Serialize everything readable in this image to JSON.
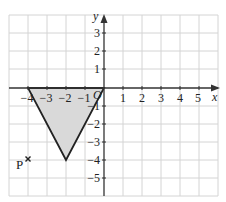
{
  "diagram": {
    "type": "coordinate-grid",
    "x_axis": {
      "label": "x",
      "range": [
        -5,
        6
      ],
      "tick_labels": [
        "−4",
        "−3",
        "−2",
        "−1",
        "1",
        "2",
        "3",
        "4",
        "5"
      ],
      "tick_values": [
        -4,
        -3,
        -2,
        -1,
        1,
        2,
        3,
        4,
        5
      ]
    },
    "y_axis": {
      "label": "y",
      "range": [
        -6,
        4
      ],
      "tick_labels": [
        "3",
        "2",
        "1",
        "−1",
        "−2",
        "−3",
        "−4",
        "−5"
      ],
      "tick_values": [
        3,
        2,
        1,
        -1,
        -2,
        -3,
        -4,
        -5
      ]
    },
    "origin_label": "O",
    "shape": {
      "name": "triangle",
      "vertices": [
        [
          -4,
          0
        ],
        [
          0,
          0
        ],
        [
          -2,
          -4
        ]
      ],
      "fill_color": "#d9d9d9",
      "stroke_color": "#222222"
    },
    "point": {
      "label": "P",
      "marker": "×",
      "coords": [
        -4,
        -4
      ]
    },
    "colors": {
      "grid": "#d4d4d4",
      "axis": "#333333"
    }
  }
}
